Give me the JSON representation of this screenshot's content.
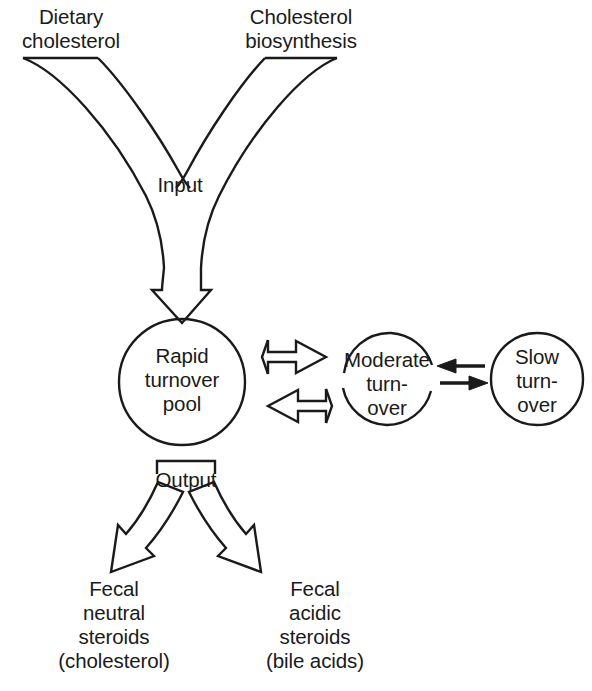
{
  "figure": {
    "stroke_color": "#1a1a1a",
    "text_color": "#1a1a1a",
    "background": "#ffffff"
  },
  "inputs": {
    "dietary": "Dietary\ncholesterol",
    "biosynthesis": "Cholesterol\nbiosynthesis",
    "input_label": "Input"
  },
  "pools": {
    "rapid": "Rapid\nturnover\npool",
    "moderate": "Moderate\nturn-\nover",
    "slow": "Slow\nturn-\nover"
  },
  "output": {
    "output_label": "Output",
    "neutral": "Fecal\nneutral\nsteroids\n(cholesterol)",
    "acidic": "Fecal\nacidic\nsteroids\n(bile acids)"
  },
  "arrows": {
    "input_arrow": "down-block-arrow",
    "pool-to-moderate": "right-block-arrow",
    "moderate-to-pool": "left-block-arrow",
    "slow-to-moderate": "left-line-arrow",
    "moderate-to-slow": "right-line-arrow",
    "output-left": "curved-block-arrow-down-left",
    "output-right": "curved-block-arrow-down-right"
  }
}
